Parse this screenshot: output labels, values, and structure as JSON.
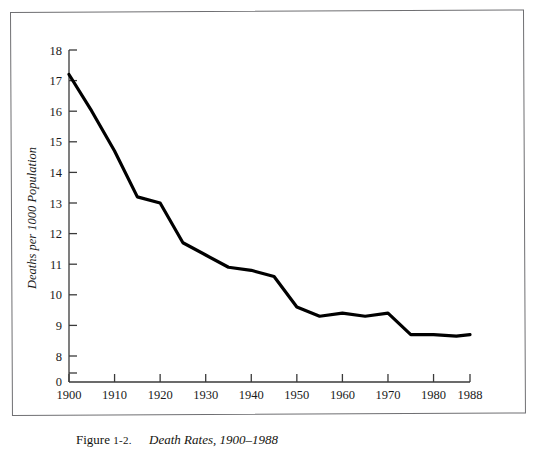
{
  "figure": {
    "caption_prefix": "Figure",
    "caption_number": "1-2.",
    "caption_title": "Death Rates, 1900–1988"
  },
  "chart_data": {
    "type": "line",
    "title": "Death Rates, 1900–1988",
    "xlabel": "",
    "ylabel": "Deaths per 1000 Population",
    "x": [
      1900,
      1905,
      1910,
      1915,
      1920,
      1925,
      1930,
      1935,
      1940,
      1945,
      1950,
      1955,
      1960,
      1965,
      1970,
      1975,
      1980,
      1985,
      1988
    ],
    "values": [
      17.2,
      16.0,
      14.7,
      13.2,
      13.0,
      11.7,
      11.3,
      10.9,
      10.8,
      10.6,
      9.6,
      9.3,
      9.4,
      9.3,
      9.4,
      8.7,
      8.7,
      8.65,
      8.7
    ],
    "xlim": [
      1900,
      1988
    ],
    "ylim": [
      8,
      18
    ],
    "y_axis_break": true,
    "y_axis_origin_label": "0",
    "xticks": [
      1900,
      1910,
      1920,
      1930,
      1940,
      1950,
      1960,
      1970,
      1980,
      1988
    ],
    "xtick_labels": [
      "1900",
      "1910",
      "1920",
      "1930",
      "1940",
      "1950",
      "1960",
      "1970",
      "1980",
      "1988"
    ],
    "yticks": [
      8,
      9,
      10,
      11,
      12,
      13,
      14,
      15,
      16,
      17,
      18
    ],
    "ytick_labels": [
      "8",
      "9",
      "10",
      "11",
      "12",
      "13",
      "14",
      "15",
      "16",
      "17",
      "18"
    ],
    "grid": false,
    "legend": null,
    "line_color": "#000000",
    "line_width": 3.2,
    "axis_color": "#3a3a3a",
    "background": "#ffffff"
  }
}
